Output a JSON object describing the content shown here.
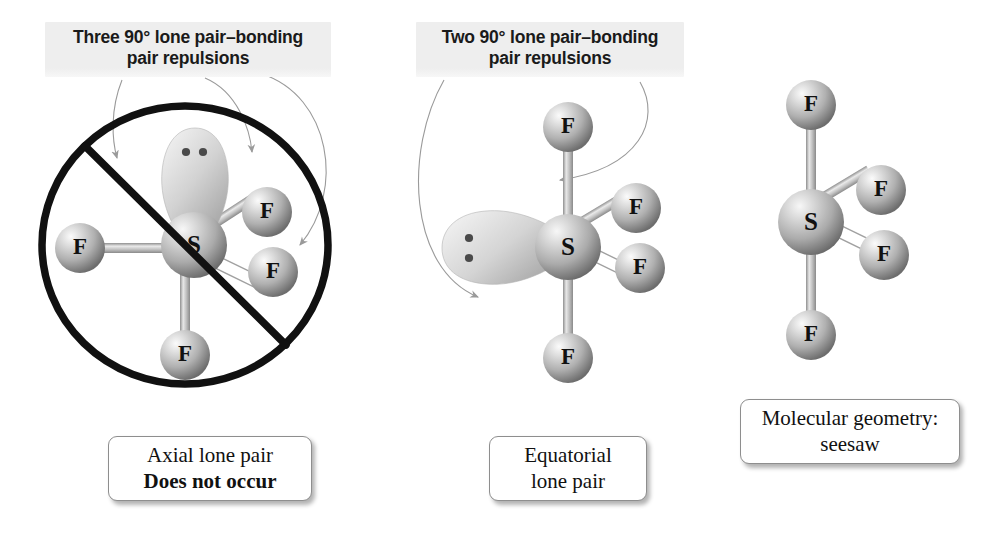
{
  "figure": {
    "topic": "VSEPR lone-pair placement in SF4 (trigonal bipyramidal electron geometry)",
    "background_color": "#ffffff"
  },
  "annotations": [
    {
      "id": "axial-repulsion-label",
      "text": "Three 90° lone pair–bonding\npair repulsions",
      "arrow_count": 3
    },
    {
      "id": "equatorial-repulsion-label",
      "text": "Two 90° lone pair–bonding\npair repulsions",
      "arrow_count": 2
    }
  ],
  "captions": [
    {
      "id": "axial-caption",
      "line1": "Axial lone pair",
      "line2": "Does not occur",
      "line2_bold": true
    },
    {
      "id": "equatorial-caption",
      "line1": "Equatorial",
      "line2": "lone pair",
      "line2_bold": false
    },
    {
      "id": "geometry-caption",
      "line1": "Molecular geometry:",
      "line2": "seesaw",
      "line2_bold": false
    }
  ],
  "structures": [
    {
      "id": "axial-lone-pair-structure",
      "name": "Axial lone pair structure (crossed out)",
      "crossed_out": true,
      "central_atom": "S",
      "lone_pair": {
        "position": "axial-up",
        "electron_dots": 2
      },
      "ligands": [
        {
          "label": "F",
          "position": "equatorial-left",
          "bond_style": "solid"
        },
        {
          "label": "F",
          "position": "equatorial-upper-right",
          "bond_style": "solid"
        },
        {
          "label": "F",
          "position": "equatorial-lower-right",
          "bond_style": "hollow-wedge"
        },
        {
          "label": "F",
          "position": "axial-down",
          "bond_style": "solid"
        }
      ]
    },
    {
      "id": "equatorial-lone-pair-structure",
      "name": "Equatorial lone pair structure",
      "crossed_out": false,
      "central_atom": "S",
      "lone_pair": {
        "position": "equatorial-left",
        "electron_dots": 2
      },
      "ligands": [
        {
          "label": "F",
          "position": "axial-up",
          "bond_style": "solid"
        },
        {
          "label": "F",
          "position": "equatorial-upper-right",
          "bond_style": "solid"
        },
        {
          "label": "F",
          "position": "equatorial-lower-right",
          "bond_style": "hollow-wedge"
        },
        {
          "label": "F",
          "position": "axial-down",
          "bond_style": "solid"
        }
      ]
    },
    {
      "id": "seesaw-structure",
      "name": "Seesaw molecular geometry",
      "crossed_out": false,
      "central_atom": "S",
      "lone_pair": null,
      "ligands": [
        {
          "label": "F",
          "position": "axial-up",
          "bond_style": "solid"
        },
        {
          "label": "F",
          "position": "equatorial-upper-right",
          "bond_style": "solid"
        },
        {
          "label": "F",
          "position": "equatorial-lower-right",
          "bond_style": "hollow-wedge"
        },
        {
          "label": "F",
          "position": "axial-down",
          "bond_style": "solid"
        }
      ]
    }
  ],
  "colors": {
    "sphere_light": "#f2f2f2",
    "sphere_mid": "#b9b9b9",
    "sphere_dark": "#6e6e6e",
    "lobe_light": "#e2e2e2",
    "lobe_dark": "#a8a8a8",
    "bond": "#c4c4c4",
    "prohibition_stroke": "#111111",
    "arrow_stroke": "#9a9a9a",
    "label_band": "#eeeeee",
    "text": "#111111"
  }
}
